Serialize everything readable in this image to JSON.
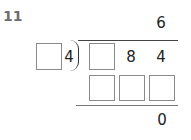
{
  "problem": {
    "number": "11",
    "type": "long-division",
    "quotient_digit": "6",
    "divisor_known_digit": "4",
    "divisor_blank_count": 1,
    "dividend_digits": [
      "",
      "8",
      "4"
    ],
    "product_row_blank_count": 3,
    "remainder": "0"
  }
}
